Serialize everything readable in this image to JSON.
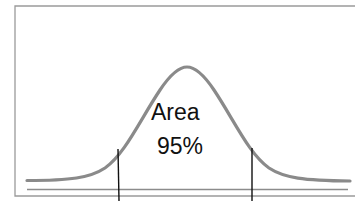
{
  "diagram": {
    "type": "normal-distribution",
    "area_label": "Area",
    "area_value": "95%",
    "colors": {
      "curve": "#8a8a8a",
      "frame": "#9a9a9a",
      "axis": "#8c8c8c",
      "bounds": "#111111",
      "text": "#111111"
    },
    "bounds": [
      "left-critical-value",
      "right-critical-value"
    ]
  }
}
